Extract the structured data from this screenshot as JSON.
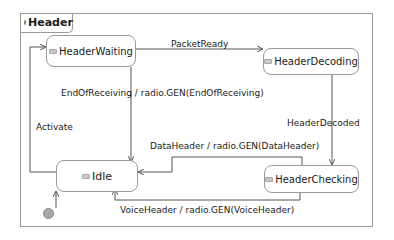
{
  "frame": {
    "title": "Header"
  },
  "states": {
    "header_waiting": "HeaderWaiting",
    "header_decoding": "HeaderDecoding",
    "idle": "Idle",
    "header_checking": "HeaderChecking"
  },
  "transitions": {
    "packet_ready": "PacketReady",
    "end_of_receiving": "EndOfReceiving / radio.GEN(EndOfReceiving)",
    "activate": "Activate",
    "header_decoded": "HeaderDecoded",
    "data_header": "DataHeader / radio.GEN(DataHeader)",
    "voice_header": "VoiceHeader / radio.GEN(VoiceHeader)"
  },
  "colors": {
    "line": "#555555",
    "border": "#9a9a9a",
    "initial": "#a8a8a8"
  }
}
